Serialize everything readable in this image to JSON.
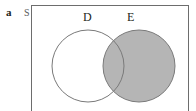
{
  "figure": {
    "panel_letter": "a",
    "universe_label": "S",
    "caption": ""
  },
  "colors": {
    "shade": "#b5b5b5",
    "outline": "#6d6d6d",
    "circle_stroke": "#7a7a7a",
    "text": "#231f20",
    "background": "#ffffff"
  },
  "diagram": {
    "type": "venn",
    "sets": [
      {
        "id": "D",
        "label": "D",
        "label_x": 87,
        "label_y": 17,
        "cx": 88,
        "cy": 66,
        "r": 36,
        "filled": false,
        "fill": "#ffffff"
      },
      {
        "id": "E",
        "label": "E",
        "label_x": 131,
        "label_y": 17,
        "cx": 139,
        "cy": 66,
        "r": 36,
        "filled": true,
        "fill": "#b5b5b5"
      }
    ],
    "regions": [
      {
        "name": "D only",
        "shaded": false
      },
      {
        "name": "D and E",
        "shaded": true
      },
      {
        "name": "E only",
        "shaded": true
      },
      {
        "name": "outside D and E",
        "shaded": false
      }
    ],
    "shaded_expression": "E",
    "universe": {
      "x": 31,
      "y": 5,
      "width": 158,
      "height": 112
    }
  }
}
